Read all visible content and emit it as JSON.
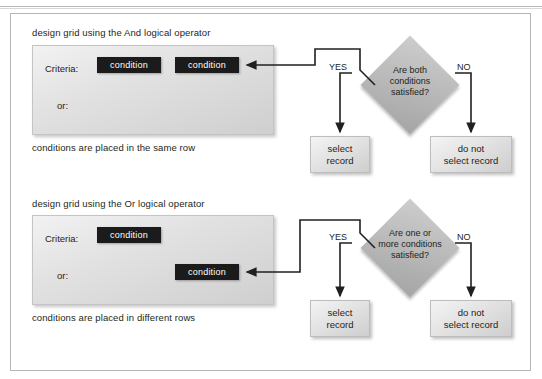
{
  "figure": {
    "type": "flowchart-diagram",
    "colors": {
      "condition_box_fill": "#1b1b1b",
      "condition_box_text": "#ffffff",
      "panel_fill": "#e2e2e2",
      "diamond_fill": "#b9b9b9",
      "result_box_fill": "#e3e3e3",
      "text": "#231f20",
      "frame_border": "#b5b5b5",
      "background": "#ffffff"
    }
  },
  "sections": [
    {
      "id": "and-operator",
      "heading": "design grid using the And logical operator",
      "caption": "conditions are placed in the same row",
      "grid": {
        "criteria_label": "Criteria:",
        "or_label": "or:",
        "criteria_conditions": [
          "condition",
          "condition"
        ],
        "or_conditions": []
      },
      "decision": {
        "question_lines": [
          "Are both",
          "conditions",
          "satisfied?"
        ],
        "yes_label": "YES",
        "no_label": "NO",
        "yes_outcome_lines": [
          "select",
          "record"
        ],
        "no_outcome_lines": [
          "do not",
          "select record"
        ]
      }
    },
    {
      "id": "or-operator",
      "heading": "design grid using the Or logical operator",
      "caption": "conditions are placed in different rows",
      "grid": {
        "criteria_label": "Criteria:",
        "or_label": "or:",
        "criteria_conditions": [
          "condition"
        ],
        "or_conditions": [
          "condition"
        ]
      },
      "decision": {
        "question_lines": [
          "Are one or",
          "more conditions",
          "satisfied?"
        ],
        "yes_label": "YES",
        "no_label": "NO",
        "yes_outcome_lines": [
          "select",
          "record"
        ],
        "no_outcome_lines": [
          "do not",
          "select record"
        ]
      }
    }
  ]
}
